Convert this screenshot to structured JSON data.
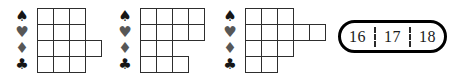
{
  "diagram": {
    "hands": [
      {
        "label": "hand-1",
        "suits": [
          {
            "name": "spade",
            "glyph": "♠",
            "color": "black",
            "cells": 3
          },
          {
            "name": "heart",
            "glyph": "♥",
            "color": "gray",
            "cells": 3
          },
          {
            "name": "diamond",
            "glyph": "♦",
            "color": "gray",
            "cells": 4
          },
          {
            "name": "club",
            "glyph": "♣",
            "color": "black",
            "cells": 3
          }
        ]
      },
      {
        "label": "hand-2",
        "suits": [
          {
            "name": "spade",
            "glyph": "♠",
            "color": "black",
            "cells": 4
          },
          {
            "name": "heart",
            "glyph": "♥",
            "color": "gray",
            "cells": 4
          },
          {
            "name": "diamond",
            "glyph": "♦",
            "color": "gray",
            "cells": 2
          },
          {
            "name": "club",
            "glyph": "♣",
            "color": "black",
            "cells": 3
          }
        ]
      },
      {
        "label": "hand-3",
        "suits": [
          {
            "name": "spade",
            "glyph": "♠",
            "color": "black",
            "cells": 3
          },
          {
            "name": "heart",
            "glyph": "♥",
            "color": "gray",
            "cells": 5
          },
          {
            "name": "diamond",
            "glyph": "♦",
            "color": "gray",
            "cells": 3
          },
          {
            "name": "club",
            "glyph": "♣",
            "color": "black",
            "cells": 2
          }
        ]
      }
    ],
    "point_range": {
      "values": [
        "16",
        "17",
        "18"
      ]
    },
    "colors": {
      "black_suit": "#161616",
      "gray_suit": "#575757",
      "grid_line": "#2e2e2e",
      "pill_border": "#000000",
      "text": "#1a1a1a",
      "background": "#ffffff"
    }
  }
}
